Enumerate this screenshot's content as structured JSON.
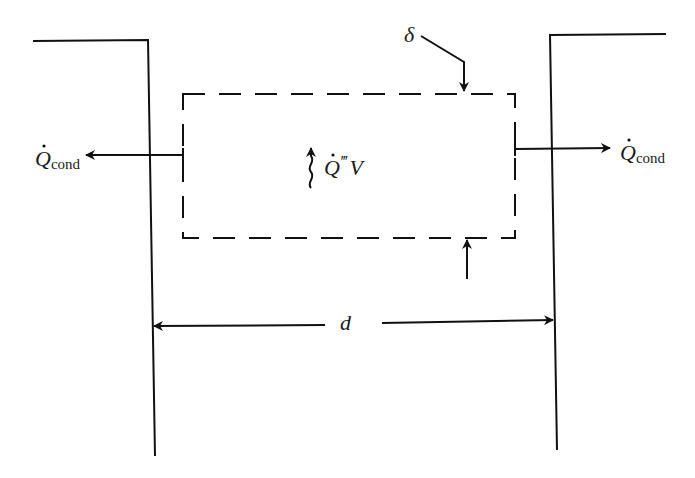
{
  "diagram": {
    "type": "heat-conduction-control-volume",
    "labels": {
      "q_cond_left_main": "Q",
      "q_cond_left_sub": "cond",
      "q_cond_right_main": "Q",
      "q_cond_right_sub": "cond",
      "generation_main": "Q",
      "generation_primes": "‴",
      "generation_volume": "V",
      "thickness": "δ",
      "spacing": "d"
    },
    "elements": {
      "left_wall": "solid line, top-left step",
      "right_wall": "solid line, top-right step",
      "control_volume": "dashed rectangle",
      "left_heat_flow_arrow": "arrow pointing left",
      "right_heat_flow_arrow": "arrow pointing right",
      "generation_arrow": "wavy arrow pointing up",
      "thickness_leader_top": "leader arrow pointing down",
      "thickness_leader_bottom": "arrow pointing up",
      "spacing_dimension": "double-headed dimension line"
    },
    "colors": {
      "line": "#111111",
      "background": "#ffffff"
    }
  }
}
